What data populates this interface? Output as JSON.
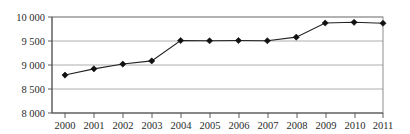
{
  "chart_data": {
    "type": "line",
    "title": "",
    "xlabel": "",
    "ylabel": "",
    "categories": [
      "2000",
      "2001",
      "2002",
      "2003",
      "2004",
      "2005",
      "2006",
      "2007",
      "2008",
      "2009",
      "2010",
      "2011"
    ],
    "values": [
      8790,
      8920,
      9020,
      9085,
      9510,
      9505,
      9510,
      9505,
      9580,
      9875,
      9890,
      9870
    ],
    "series": [
      {
        "name": "",
        "values": [
          8790,
          8920,
          9020,
          9085,
          9510,
          9505,
          9510,
          9505,
          9580,
          9875,
          9890,
          9870
        ]
      }
    ],
    "ylim": [
      8000,
      10000
    ],
    "yticks": [
      8000,
      8500,
      9000,
      9500,
      10000
    ],
    "ytick_labels": [
      "8 000",
      "8 500",
      "9 000",
      "9 500",
      "10 000"
    ],
    "xtick_labels": [
      "2000",
      "2001",
      "2002",
      "2003",
      "2004",
      "2005",
      "2006",
      "2007",
      "2008",
      "2009",
      "2010",
      "2011"
    ],
    "grid": true,
    "grid_axis": "y",
    "legend": false,
    "legend_position": "none",
    "marker": "diamond",
    "line_color": "#222222",
    "marker_color": "#111111",
    "grid_color": "#9a9a9a"
  }
}
